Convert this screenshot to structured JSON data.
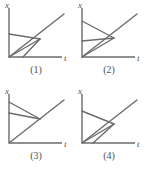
{
  "figure": {
    "type": "spacetime-diagram-set",
    "panel_count": 4,
    "line_color": "#6b6b6b",
    "axis_color": "#6b6b6b",
    "text_color": "#4f4f4f",
    "background": "#ffffff"
  },
  "panels": [
    {
      "id": "panel-1",
      "caption": "(1)",
      "x_axis_label": "x",
      "t_axis_label": "t",
      "lines": [
        {
          "name": "diagonal-ray",
          "x1": 9,
          "y1": 57,
          "x2": 64,
          "y2": 14
        },
        {
          "name": "upper-worldline",
          "x1": 9,
          "y1": 34,
          "x2": 40,
          "y2": 39
        },
        {
          "name": "lower-worldline",
          "x1": 9,
          "y1": 57,
          "x2": 40,
          "y2": 39
        },
        {
          "name": "steep-worldline",
          "x1": 23,
          "y1": 57,
          "x2": 40,
          "y2": 39
        }
      ]
    },
    {
      "id": "panel-2",
      "caption": "(2)",
      "x_axis_label": "x",
      "t_axis_label": "t",
      "lines": [
        {
          "name": "diagonal-ray",
          "x1": 9,
          "y1": 57,
          "x2": 64,
          "y2": 14
        },
        {
          "name": "upper-worldline",
          "x1": 9,
          "y1": 21,
          "x2": 41,
          "y2": 38
        },
        {
          "name": "middle-worldline",
          "x1": 9,
          "y1": 41,
          "x2": 41,
          "y2": 38
        },
        {
          "name": "lower-worldline",
          "x1": 9,
          "y1": 57,
          "x2": 41,
          "y2": 38
        }
      ]
    },
    {
      "id": "panel-3",
      "caption": "(3)",
      "x_axis_label": "x",
      "t_axis_label": "t",
      "lines": [
        {
          "name": "diagonal-ray",
          "x1": 9,
          "y1": 57,
          "x2": 64,
          "y2": 14
        },
        {
          "name": "upper-worldline",
          "x1": 9,
          "y1": 16,
          "x2": 40,
          "y2": 33
        },
        {
          "name": "lower-worldline",
          "x1": 9,
          "y1": 27,
          "x2": 40,
          "y2": 33
        }
      ]
    },
    {
      "id": "panel-4",
      "caption": "(4)",
      "x_axis_label": "x",
      "t_axis_label": "t",
      "lines": [
        {
          "name": "diagonal-ray",
          "x1": 9,
          "y1": 57,
          "x2": 64,
          "y2": 14
        },
        {
          "name": "upper-worldline",
          "x1": 9,
          "y1": 25,
          "x2": 41,
          "y2": 38
        },
        {
          "name": "steep-worldline-a",
          "x1": 9,
          "y1": 57,
          "x2": 41,
          "y2": 38
        },
        {
          "name": "steep-worldline-b",
          "x1": 20,
          "y1": 57,
          "x2": 41,
          "y2": 38
        }
      ]
    }
  ]
}
